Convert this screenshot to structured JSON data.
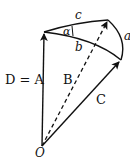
{
  "diagram": {
    "labels": {
      "c": "c",
      "alpha": "α",
      "b": "b",
      "a": "a",
      "d_eq_a": "D = A",
      "B": "B",
      "C": "C",
      "O": "O"
    },
    "stroke_color": "#111111"
  }
}
